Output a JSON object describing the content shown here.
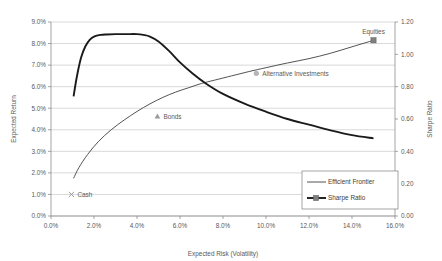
{
  "chart_data": {
    "type": "line",
    "title": "",
    "xlabel": "Expected Risk (Volatility)",
    "ylabel": "Expected Return",
    "y2label": "Sharpe Ratio",
    "grid": true,
    "legend_position": "bottom-right",
    "xlim": [
      0.0,
      16.0
    ],
    "ylim": [
      0.0,
      9.0
    ],
    "y2lim": [
      0.0,
      1.2
    ],
    "xticks": [
      "0.0%",
      "2.0%",
      "4.0%",
      "6.0%",
      "8.0%",
      "10.0%",
      "12.0%",
      "14.0%",
      "16.0%"
    ],
    "xtick_values": [
      0,
      2,
      4,
      6,
      8,
      10,
      12,
      14,
      16
    ],
    "yticks": [
      "0.0%",
      "1.0%",
      "2.0%",
      "3.0%",
      "4.0%",
      "5.0%",
      "6.0%",
      "7.0%",
      "8.0%",
      "9.0%"
    ],
    "ytick_values": [
      0,
      1,
      2,
      3,
      4,
      5,
      6,
      7,
      8,
      9
    ],
    "y2ticks": [
      "0.00",
      "0.20",
      "0.40",
      "0.60",
      "0.80",
      "1.00",
      "1.20"
    ],
    "y2tick_values": [
      0,
      0.2,
      0.4,
      0.6,
      0.8,
      1.0,
      1.2
    ],
    "series": [
      {
        "name": "Efficient Frontier",
        "axis": "left",
        "style": "thin-line",
        "x": [
          1.05,
          1.3,
          1.7,
          2.2,
          2.8,
          3.4,
          4.0,
          4.6,
          5.2,
          5.8,
          6.4,
          7.0,
          7.6,
          8.4,
          9.2,
          10.0,
          11.0,
          12.0,
          13.0,
          14.0,
          15.0
        ],
        "values": [
          1.75,
          2.25,
          2.85,
          3.45,
          4.0,
          4.45,
          4.85,
          5.2,
          5.5,
          5.75,
          5.95,
          6.15,
          6.3,
          6.5,
          6.7,
          6.88,
          7.1,
          7.3,
          7.55,
          7.85,
          8.15
        ]
      },
      {
        "name": "Sharpe Ratio",
        "axis": "right",
        "style": "thick-line",
        "x": [
          1.05,
          1.2,
          1.4,
          1.6,
          1.8,
          2.0,
          2.3,
          2.6,
          3.0,
          3.5,
          4.0,
          4.3,
          4.6,
          5.0,
          5.5,
          6.0,
          6.6,
          7.2,
          8.0,
          9.0,
          10.0,
          11.0,
          12.0,
          13.0,
          14.0,
          15.0
        ],
        "values": [
          0.74,
          0.86,
          0.98,
          1.05,
          1.09,
          1.11,
          1.12,
          1.123,
          1.125,
          1.125,
          1.125,
          1.12,
          1.11,
          1.08,
          1.02,
          0.95,
          0.88,
          0.82,
          0.755,
          0.695,
          0.645,
          0.6,
          0.565,
          0.53,
          0.5,
          0.48
        ]
      }
    ],
    "points": [
      {
        "label": "Cash",
        "marker": "x",
        "x": 0.95,
        "y": 1.0,
        "axis": "left",
        "label_dx": 6,
        "label_dy": 2.5
      },
      {
        "label": "Bonds",
        "marker": "triangle",
        "x": 4.95,
        "y": 4.62,
        "axis": "left",
        "label_dx": 6,
        "label_dy": 2.5
      },
      {
        "label": "Alternative Investments",
        "marker": "circle",
        "x": 9.55,
        "y": 6.62,
        "axis": "left",
        "label_dx": 6,
        "label_dy": 2.5
      },
      {
        "label": "Equities",
        "marker": "square",
        "x": 15.0,
        "y": 8.15,
        "axis": "left",
        "label_dx": 0,
        "label_dy": -6
      }
    ],
    "legend": [
      {
        "label": "Efficient Frontier",
        "marker": "thin-line"
      },
      {
        "label": "Sharpe Ratio",
        "marker": "thick-line-square"
      }
    ]
  },
  "colors": {
    "frontier": "#3f3f3f",
    "sharpe": "#1a1a1a",
    "grid": "#bfbfbf",
    "axis": "#7f7f7f",
    "text": "#595959",
    "background": "#ffffff"
  }
}
